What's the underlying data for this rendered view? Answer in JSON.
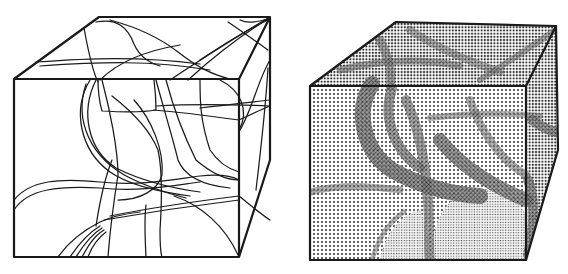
{
  "figure": {
    "width": 568,
    "height": 274,
    "background": "#ffffff",
    "ink": "#1a1a1a",
    "panels": [
      {
        "id": "left",
        "style": "line-drawing",
        "description": "Wireframe cube with curved intersection lines",
        "cube": {
          "front": [
            [
              14,
              79
            ],
            [
              239,
              79
            ],
            [
              239,
              257
            ],
            [
              14,
              257
            ]
          ],
          "top_back_left": [
            99,
            17
          ],
          "top_back_right": [
            270,
            17
          ],
          "right_back_bottom": [
            270,
            160
          ]
        }
      },
      {
        "id": "right",
        "style": "halftone-shaded",
        "description": "Same cube rendered with halftone dot shading of surfaces",
        "cube": {
          "front": [
            [
              310,
              86
            ],
            [
              526,
              86
            ],
            [
              526,
              260
            ],
            [
              310,
              260
            ]
          ],
          "top_back_left": [
            396,
            22
          ],
          "top_back_right": [
            556,
            26
          ],
          "right_back_bottom": [
            558,
            150
          ]
        },
        "tones": {
          "light": "#d8d8d8",
          "mid": "#a8a8a8",
          "dark": "#6a6a6a"
        }
      }
    ]
  }
}
